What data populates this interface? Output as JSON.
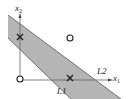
{
  "diagram": {
    "axes": {
      "x1_label": "x",
      "x1_sub": "1",
      "x2_label": "x",
      "x2_sub": "2"
    },
    "lines": [
      {
        "label": "L1"
      },
      {
        "label": "L2"
      }
    ],
    "points": [
      {
        "marker": "x",
        "class": "cross",
        "position": "on x2 axis, upper"
      },
      {
        "marker": "x",
        "class": "cross",
        "position": "on x1 axis, middle"
      },
      {
        "marker": "o",
        "class": "circle",
        "position": "origin"
      },
      {
        "marker": "o",
        "class": "circle",
        "position": "upper right, outside band"
      }
    ],
    "colors": {
      "band_fill": "#b3b3b3",
      "line": "#555555",
      "axis": "#666666"
    }
  }
}
